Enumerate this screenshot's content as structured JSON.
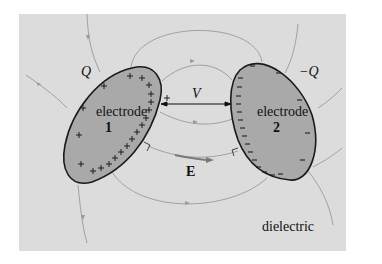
{
  "figure": {
    "background": "#dcdcdc",
    "electrode_fill": "#a9a9a9",
    "outline_color": "#1a1a1a",
    "field_line_color": "#9a9a9a",
    "e_arrow_color": "#7a7a7a"
  },
  "labels": {
    "charge_pos": "Q",
    "charge_neg": "−Q",
    "electrode1_name": "electrode",
    "electrode1_num": "1",
    "electrode2_name": "electrode",
    "electrode2_num": "2",
    "voltage": "V",
    "field": "E",
    "medium": "dielectric",
    "plus_sign": "+",
    "minus_sign": "−"
  }
}
